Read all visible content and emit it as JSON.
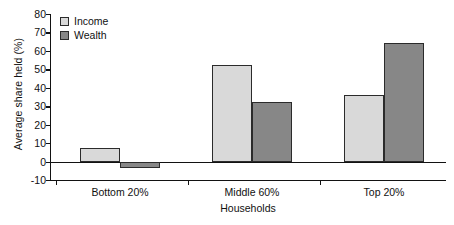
{
  "chart_data": {
    "type": "bar",
    "title": "",
    "subtitle": "",
    "xlabel": "Households",
    "ylabel": "Average share held (%)",
    "categories": [
      "Bottom 20%",
      "Middle 60%",
      "Top 20%"
    ],
    "series": [
      {
        "name": "Income",
        "values": [
          7.5,
          52.5,
          36
        ],
        "color": "#d9d9d9"
      },
      {
        "name": "Wealth",
        "values": [
          -3.5,
          32.5,
          64.5
        ],
        "color": "#878787"
      }
    ],
    "ylim": [
      -10,
      80
    ],
    "yticks": [
      80,
      70,
      60,
      50,
      40,
      30,
      20,
      10,
      0,
      -10
    ],
    "ytick_labels": [
      "80",
      "70",
      "60",
      "50",
      "40",
      "30",
      "20",
      "10",
      "0",
      "-10"
    ],
    "grid": false,
    "legend_position": "top-left",
    "legend_entries": [
      "Income",
      "Wealth"
    ],
    "axis_color": "#121212",
    "bar_edge_color": "#2b2b2b",
    "background": "#ffffff"
  }
}
